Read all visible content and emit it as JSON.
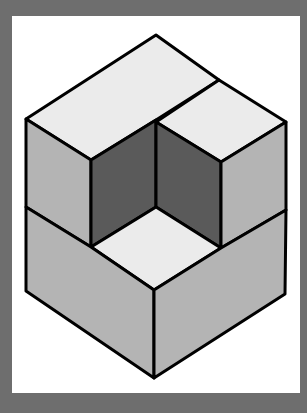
{
  "figure": {
    "colors": {
      "frame": "#6e6e6e",
      "background": "#ffffff",
      "top_face": "#ebebeb",
      "side_face": "#b4b4b4",
      "cavity_face": "#5a5a5a",
      "outline": "#000000"
    },
    "faces": [
      {
        "name": "l-top-face",
        "fill": "top_face",
        "points": "156,35 219,80 156,120 91,160 26,119"
      },
      {
        "name": "small-cube-top",
        "fill": "top_face",
        "points": "219,80 286,122 221,162 156,122"
      },
      {
        "name": "left-upper-side",
        "fill": "side_face",
        "points": "26,119 91,160 91,247 26,207"
      },
      {
        "name": "cavity-left-wall",
        "fill": "cavity_face",
        "points": "91,160 156,120 156,207 91,247"
      },
      {
        "name": "cavity-right-wall",
        "fill": "cavity_face",
        "points": "156,122 221,162 221,248 156,207"
      },
      {
        "name": "small-cube-right-side",
        "fill": "side_face",
        "points": "221,162 286,122 286,210 221,248"
      },
      {
        "name": "cavity-floor",
        "fill": "top_face",
        "points": "156,207 221,248 154,290 91,247"
      },
      {
        "name": "lower-left-side",
        "fill": "side_face",
        "points": "26,207 91,247 154,290 154,378 26,291"
      },
      {
        "name": "lower-right-side",
        "fill": "side_face",
        "points": "154,290 221,248 286,210 285,294 154,378"
      }
    ]
  }
}
